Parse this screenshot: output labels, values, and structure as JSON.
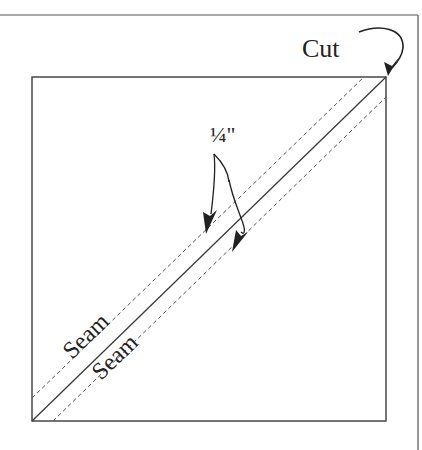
{
  "diagram": {
    "type": "quilting half-square triangle cutting diagram",
    "labels": {
      "cut": "Cut",
      "seam_allowance": "¼\"",
      "seam_upper": "Seam",
      "seam_lower": "Seam"
    },
    "colors": {
      "line": "#3a3a3a",
      "dashed": "#555555",
      "text": "#222222",
      "background": "#ffffff"
    }
  }
}
